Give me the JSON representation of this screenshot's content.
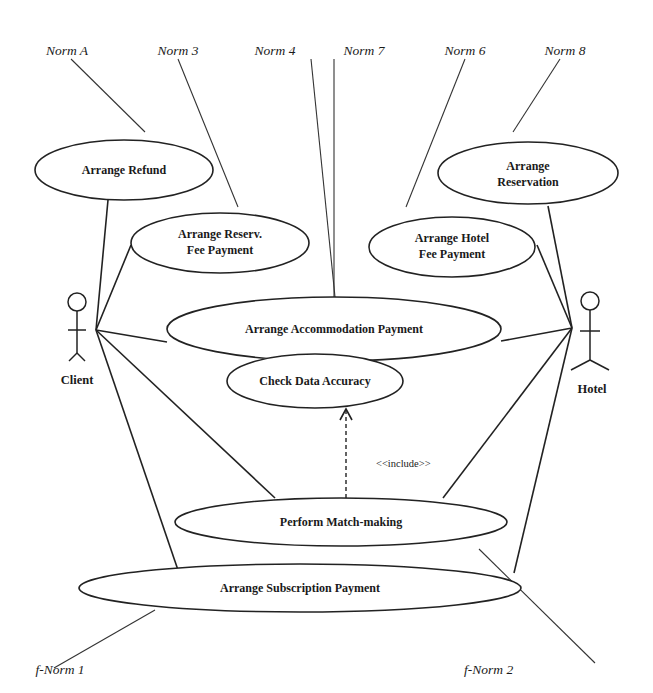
{
  "diagram": {
    "type": "UML use case diagram",
    "actors": [
      {
        "id": "client",
        "label": "Client"
      },
      {
        "id": "hotel",
        "label": "Hotel"
      }
    ],
    "use_cases": [
      {
        "id": "arrange_refund",
        "lines": [
          "Arrange Refund"
        ]
      },
      {
        "id": "arrange_reserv_fee_payment",
        "lines": [
          "Arrange Reserv.",
          "Fee Payment"
        ]
      },
      {
        "id": "arrange_reservation",
        "lines": [
          "Arrange",
          "Reservation"
        ]
      },
      {
        "id": "arrange_hotel_fee_payment",
        "lines": [
          "Arrange Hotel",
          "Fee Payment"
        ]
      },
      {
        "id": "arrange_accommodation_payment",
        "lines": [
          "Arrange Accommodation Payment"
        ]
      },
      {
        "id": "check_data_accuracy",
        "lines": [
          "Check Data Accuracy"
        ]
      },
      {
        "id": "perform_match_making",
        "lines": [
          "Perform Match-making"
        ]
      },
      {
        "id": "arrange_subscription_payment",
        "lines": [
          "Arrange Subscription Payment"
        ]
      }
    ],
    "relationships": [
      {
        "type": "include",
        "label": "<<include>>",
        "from": "perform_match_making",
        "to": "check_data_accuracy"
      }
    ],
    "norms": [
      {
        "label": "Norm A",
        "attached_to": "arrange_refund"
      },
      {
        "label": "Norm 3",
        "attached_to": "arrange_reserv_fee_payment"
      },
      {
        "label": "Norm 4",
        "attached_to": "arrange_accommodation_payment"
      },
      {
        "label": "Norm 7",
        "attached_to": "arrange_accommodation_payment"
      },
      {
        "label": "Norm 6",
        "attached_to": "arrange_hotel_fee_payment"
      },
      {
        "label": "Norm 8",
        "attached_to": "arrange_reservation"
      },
      {
        "label": "f-Norm 1",
        "attached_to": "arrange_subscription_payment"
      },
      {
        "label": "f-Norm 2",
        "attached_to": "perform_match_making"
      }
    ]
  }
}
